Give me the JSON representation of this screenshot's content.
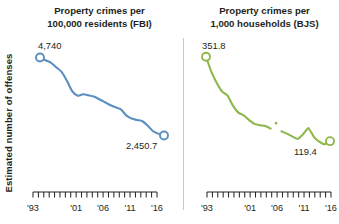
{
  "figure": {
    "ylabel": "Estimated number of offenses",
    "divider_color": "#c9c9c9"
  },
  "panels": {
    "fbi": {
      "title_line1": "Property crimes per",
      "title_line2": "100,000 residents (FBI)",
      "start_label": "4,740",
      "end_label": "2,450.7"
    },
    "bjs": {
      "title_line1": "Property crimes per",
      "title_line2": "1,000 households (BJS)",
      "start_label": "351.8",
      "end_label": "119.4"
    }
  },
  "axis": {
    "tick_labels": [
      "'93",
      "'01",
      "'06",
      "'11",
      "'16"
    ],
    "tick_label_years": [
      1993,
      2001,
      2006,
      2011,
      2016
    ],
    "year_start": 1993,
    "year_end": 2016
  },
  "chart_data": [
    {
      "type": "line",
      "id": "fbi",
      "title": "Property crimes per 100,000 residents (FBI)",
      "xlabel": "",
      "ylabel": "Estimated number of offenses",
      "color": "#5b8fc0",
      "marker": "open-circle",
      "grid": false,
      "legend": "none",
      "xlim": [
        1993,
        2016
      ],
      "ylim": [
        2200,
        4900
      ],
      "x": [
        1993,
        1994,
        1995,
        1996,
        1997,
        1998,
        1999,
        2000,
        2001,
        2002,
        2003,
        2004,
        2005,
        2006,
        2007,
        2008,
        2009,
        2010,
        2011,
        2012,
        2013,
        2014,
        2015,
        2016
      ],
      "values": [
        4740,
        4660,
        4591,
        4451,
        4316,
        4053,
        3744,
        3618,
        3658,
        3631,
        3591,
        3514,
        3431,
        3346,
        3276,
        3215,
        3041,
        2946,
        2905,
        2868,
        2734,
        2574,
        2500,
        2450.7
      ],
      "labeled_points": [
        {
          "x": 1993,
          "y": 4740,
          "label": "4,740"
        },
        {
          "x": 2016,
          "y": 2450.7,
          "label": "2,450.7"
        }
      ]
    },
    {
      "type": "line",
      "id": "bjs",
      "title": "Property crimes per 1,000 households (BJS)",
      "xlabel": "",
      "ylabel": "Estimated number of offenses",
      "color": "#8cb84a",
      "marker": "open-circle",
      "grid": false,
      "legend": "none",
      "series_break_year": 2006,
      "xlim": [
        1993,
        2016
      ],
      "ylim": [
        95,
        365
      ],
      "x": [
        1993,
        1994,
        1995,
        1996,
        1997,
        1998,
        1999,
        2000,
        2001,
        2002,
        2003,
        2004,
        2005,
        2006,
        2007,
        2008,
        2009,
        2010,
        2011,
        2012,
        2013,
        2014,
        2015,
        2016
      ],
      "values": [
        351.8,
        310.2,
        279.6,
        255.9,
        245.0,
        217.4,
        198.0,
        190.4,
        177.4,
        166.9,
        163.2,
        161.1,
        154.0,
        169.0,
        146.5,
        140.0,
        132.6,
        125.4,
        138.7,
        155.8,
        131.4,
        118.1,
        110.7,
        119.4
      ],
      "labeled_points": [
        {
          "x": 1993,
          "y": 351.8,
          "label": "351.8"
        },
        {
          "x": 2016,
          "y": 119.4,
          "label": "119.4"
        }
      ]
    }
  ]
}
